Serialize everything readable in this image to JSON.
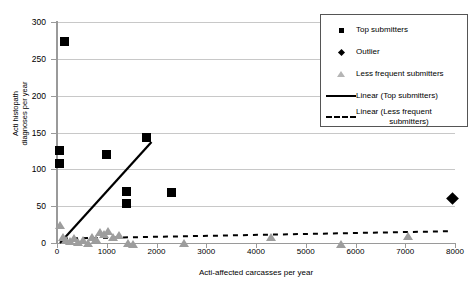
{
  "chart_data": {
    "type": "scatter",
    "title": "",
    "xlabel": "Acti-affected carcasses per year",
    "ylabel_line1": "Acti histopath",
    "ylabel_line2": "diagnoses per year",
    "xlim": [
      0,
      8000
    ],
    "ylim": [
      0,
      300
    ],
    "xticks": [
      0,
      1000,
      2000,
      3000,
      4000,
      5000,
      6000,
      7000,
      8000
    ],
    "yticks": [
      0,
      50,
      100,
      150,
      200,
      250,
      300
    ],
    "grid": "horizontal",
    "legend_position": "top-right-inside",
    "series": [
      {
        "name": "Top submitters",
        "marker": "square",
        "color": "#000000",
        "points": [
          [
            150,
            273
          ],
          [
            60,
            125
          ],
          [
            60,
            108
          ],
          [
            1000,
            120
          ],
          [
            1800,
            143
          ],
          [
            1400,
            70
          ],
          [
            1400,
            53
          ],
          [
            2300,
            68
          ]
        ]
      },
      {
        "name": "Outlier",
        "marker": "diamond",
        "color": "#000000",
        "points": [
          [
            7950,
            60
          ]
        ]
      },
      {
        "name": "Less frequent submitters",
        "marker": "triangle",
        "color": "#9d9d9d",
        "points": [
          [
            60,
            30
          ],
          [
            120,
            14
          ],
          [
            180,
            10
          ],
          [
            260,
            8
          ],
          [
            340,
            12
          ],
          [
            420,
            7
          ],
          [
            520,
            9
          ],
          [
            620,
            6
          ],
          [
            700,
            14
          ],
          [
            780,
            11
          ],
          [
            860,
            20
          ],
          [
            940,
            17
          ],
          [
            1020,
            22
          ],
          [
            1120,
            13
          ],
          [
            1240,
            16
          ],
          [
            1420,
            5
          ],
          [
            1520,
            4
          ],
          [
            2550,
            5
          ],
          [
            4300,
            14
          ],
          [
            5700,
            4
          ],
          [
            7050,
            15
          ]
        ]
      }
    ],
    "trendlines": [
      {
        "name": "Linear (Top submitters)",
        "style": "solid",
        "color": "#000000",
        "x_start": 60,
        "y_start": 0,
        "x_end": 1900,
        "y_end": 137
      },
      {
        "name": "Linear (Less frequent submitters)",
        "style": "dashed",
        "color": "#000000",
        "x_start": 120,
        "y_start": 6,
        "x_end": 7900,
        "y_end": 16
      }
    ]
  },
  "legend": {
    "items": [
      {
        "label": "Top submitters",
        "key": "square-marker"
      },
      {
        "label": "Outlier",
        "key": "diamond-marker"
      },
      {
        "label": "Less frequent submitters",
        "key": "triangle-marker"
      },
      {
        "label": "Linear (Top submitters)",
        "key": "solid-line"
      },
      {
        "label": "Linear (Less frequent",
        "label2": "submitters)",
        "key": "dashed-line"
      }
    ]
  }
}
